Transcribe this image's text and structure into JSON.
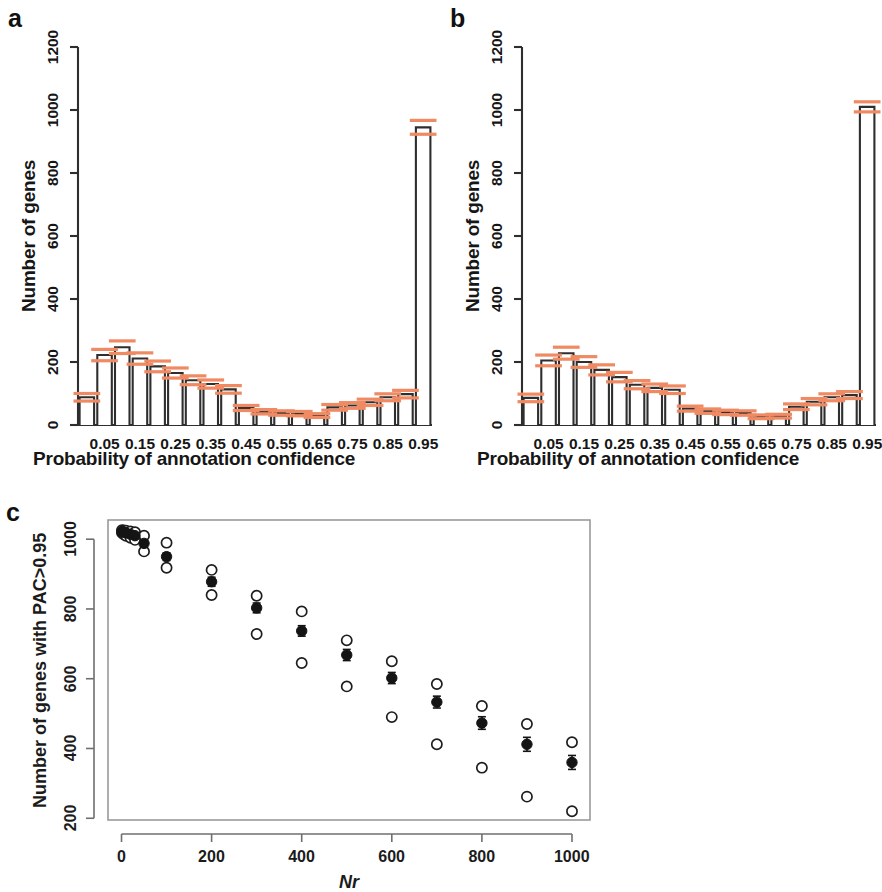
{
  "figure": {
    "panel_letters": [
      "a",
      "b",
      "c"
    ],
    "accent_error_color": "#ef8a63",
    "bar_stroke_color": "#2e2e2e",
    "point_color": "#141414"
  },
  "chart_data": [
    {
      "id": "panel-a",
      "type": "bar",
      "panel": "a",
      "title": "",
      "xlabel": "Probability of annotation confidence",
      "ylabel": "Number of genes",
      "ylim": [
        0,
        1200
      ],
      "yticks": [
        0,
        200,
        400,
        600,
        800,
        1000,
        1200
      ],
      "ytick_labels": [
        "0",
        "200",
        "400",
        "600",
        "800",
        "1000",
        "1200"
      ],
      "xtick_labels": [
        "0.05",
        "0.15",
        "0.25",
        "0.35",
        "0.45",
        "0.55",
        "0.65",
        "0.75",
        "0.85",
        "0.95"
      ],
      "bin_centers": [
        0.025,
        0.075,
        0.125,
        0.175,
        0.225,
        0.275,
        0.325,
        0.375,
        0.425,
        0.475,
        0.525,
        0.575,
        0.625,
        0.675,
        0.725,
        0.775,
        0.825,
        0.875,
        0.925,
        0.975
      ],
      "categories": [
        "0.00-0.05",
        "0.05-0.10",
        "0.10-0.15",
        "0.15-0.20",
        "0.20-0.25",
        "0.25-0.30",
        "0.30-0.35",
        "0.35-0.40",
        "0.40-0.45",
        "0.45-0.50",
        "0.50-0.55",
        "0.55-0.60",
        "0.60-0.65",
        "0.65-0.70",
        "0.70-0.75",
        "0.75-0.80",
        "0.80-0.85",
        "0.85-0.90",
        "0.90-0.95",
        "0.95-1.00"
      ],
      "values": [
        88,
        222,
        247,
        211,
        186,
        165,
        142,
        130,
        113,
        54,
        42,
        38,
        36,
        30,
        56,
        62,
        72,
        88,
        98,
        945
      ],
      "errors": [
        12,
        18,
        20,
        18,
        17,
        16,
        14,
        13,
        12,
        8,
        7,
        7,
        7,
        6,
        9,
        9,
        10,
        11,
        12,
        22
      ],
      "grid": false,
      "legend": "none"
    },
    {
      "id": "panel-b",
      "type": "bar",
      "panel": "b",
      "title": "",
      "xlabel": "Probability of annotation confidence",
      "ylabel": "Number of genes",
      "ylim": [
        0,
        1200
      ],
      "yticks": [
        0,
        200,
        400,
        600,
        800,
        1000,
        1200
      ],
      "ytick_labels": [
        "0",
        "200",
        "400",
        "600",
        "800",
        "1000",
        "1200"
      ],
      "xtick_labels": [
        "0.05",
        "0.15",
        "0.25",
        "0.35",
        "0.45",
        "0.55",
        "0.65",
        "0.75",
        "0.85",
        "0.95"
      ],
      "bin_centers": [
        0.025,
        0.075,
        0.125,
        0.175,
        0.225,
        0.275,
        0.325,
        0.375,
        0.425,
        0.475,
        0.525,
        0.575,
        0.625,
        0.675,
        0.725,
        0.775,
        0.825,
        0.875,
        0.925,
        0.975
      ],
      "categories": [
        "0.00-0.05",
        "0.05-0.10",
        "0.10-0.15",
        "0.15-0.20",
        "0.20-0.25",
        "0.25-0.30",
        "0.30-0.35",
        "0.35-0.40",
        "0.40-0.45",
        "0.45-0.50",
        "0.50-0.55",
        "0.55-0.60",
        "0.60-0.65",
        "0.65-0.70",
        "0.70-0.75",
        "0.75-0.80",
        "0.80-0.85",
        "0.85-0.90",
        "0.90-0.95",
        "0.95-1.00"
      ],
      "values": [
        86,
        205,
        228,
        200,
        175,
        152,
        128,
        118,
        112,
        52,
        44,
        40,
        38,
        26,
        28,
        58,
        74,
        88,
        95,
        1010
      ],
      "errors": [
        12,
        17,
        19,
        17,
        16,
        15,
        13,
        12,
        12,
        8,
        7,
        7,
        7,
        6,
        6,
        9,
        10,
        11,
        11,
        16
      ],
      "grid": false,
      "legend": "none"
    },
    {
      "id": "panel-c",
      "type": "scatter",
      "panel": "c",
      "title": "",
      "xlabel": "Nr",
      "ylabel": "Number of genes with PAC>0.95",
      "xlim": [
        -30,
        1040
      ],
      "ylim": [
        195,
        1055
      ],
      "xticks": [
        0,
        200,
        400,
        600,
        800,
        1000
      ],
      "xtick_labels": [
        "0",
        "200",
        "400",
        "600",
        "800",
        "1000"
      ],
      "yticks": [
        200,
        400,
        600,
        800,
        1000
      ],
      "ytick_labels": [
        "200",
        "400",
        "600",
        "800",
        "1000"
      ],
      "grid": false,
      "legend": "none",
      "series": [
        {
          "name": "mean",
          "marker": "filled-circle",
          "x": [
            1,
            5,
            10,
            20,
            30,
            50,
            100,
            200,
            300,
            400,
            500,
            600,
            700,
            800,
            900,
            1000
          ],
          "values": [
            1022,
            1020,
            1018,
            1014,
            1010,
            988,
            950,
            878,
            803,
            737,
            668,
            602,
            533,
            473,
            412,
            360
          ],
          "err": [
            4,
            4,
            5,
            6,
            6,
            9,
            11,
            13,
            14,
            15,
            16,
            16,
            17,
            18,
            20,
            20
          ]
        },
        {
          "name": "maximum",
          "marker": "open-circle",
          "x": [
            1,
            5,
            10,
            20,
            30,
            50,
            100,
            200,
            300,
            400,
            500,
            600,
            700,
            800,
            900,
            1000
          ],
          "values": [
            1026,
            1025,
            1024,
            1022,
            1020,
            1010,
            990,
            912,
            838,
            793,
            710,
            650,
            585,
            522,
            470,
            418
          ]
        },
        {
          "name": "minimum",
          "marker": "open-circle",
          "x": [
            1,
            5,
            10,
            20,
            30,
            50,
            100,
            200,
            300,
            400,
            500,
            600,
            700,
            800,
            900,
            1000
          ],
          "values": [
            1018,
            1014,
            1010,
            1004,
            998,
            965,
            918,
            840,
            728,
            645,
            578,
            490,
            412,
            345,
            262,
            220
          ]
        }
      ]
    }
  ]
}
